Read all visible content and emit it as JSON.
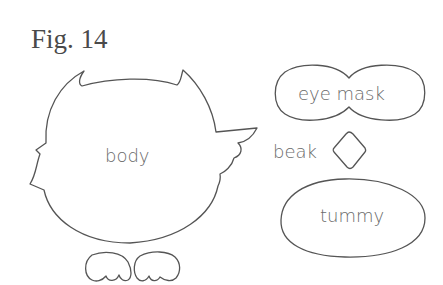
{
  "figure": {
    "title": "Fig. 14"
  },
  "pieces": {
    "body": {
      "label": "body"
    },
    "eye_mask": {
      "label": "eye mask"
    },
    "beak": {
      "label": "beak"
    },
    "tummy": {
      "label": "tummy"
    },
    "feet": {
      "count": 2
    }
  },
  "colors": {
    "outline": "#555555",
    "text": "#6a6a6a",
    "background": "#ffffff"
  }
}
